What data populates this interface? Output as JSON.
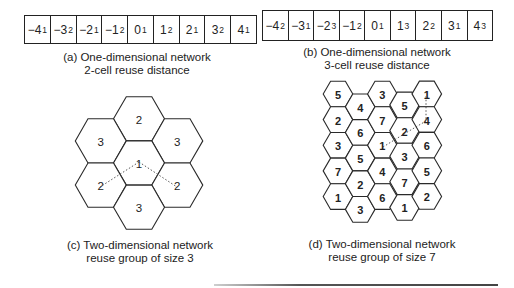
{
  "panel_a": {
    "cells": [
      {
        "base": "−4",
        "sub": "1"
      },
      {
        "base": "−3",
        "sub": "2"
      },
      {
        "base": "−2",
        "sub": "1"
      },
      {
        "base": "−1",
        "sub": "2"
      },
      {
        "base": "0",
        "sub": "1"
      },
      {
        "base": "1",
        "sub": "2"
      },
      {
        "base": "2",
        "sub": "1"
      },
      {
        "base": "3",
        "sub": "2"
      },
      {
        "base": "4",
        "sub": "1"
      }
    ],
    "caption_line1": "(a) One-dimensional network",
    "caption_line2": "2-cell reuse distance"
  },
  "panel_b": {
    "cells": [
      {
        "base": "−4",
        "sub": "2"
      },
      {
        "base": "−3",
        "sub": "1"
      },
      {
        "base": "−2",
        "sub": "3"
      },
      {
        "base": "−1",
        "sub": "2"
      },
      {
        "base": "0",
        "sub": "1"
      },
      {
        "base": "1",
        "sub": "3"
      },
      {
        "base": "2",
        "sub": "2"
      },
      {
        "base": "3",
        "sub": "1"
      },
      {
        "base": "4",
        "sub": "3"
      }
    ],
    "caption_line1": "(b) One-dimensional network",
    "caption_line2": "3-cell reuse distance"
  },
  "panel_c": {
    "cells": [
      {
        "label": "2",
        "position": "top"
      },
      {
        "label": "3",
        "position": "upper-left"
      },
      {
        "label": "3",
        "position": "upper-right"
      },
      {
        "label": "1",
        "position": "center"
      },
      {
        "label": "2",
        "position": "lower-left"
      },
      {
        "label": "2",
        "position": "lower-right"
      },
      {
        "label": "3",
        "position": "bottom"
      }
    ],
    "caption_line1": "(c) Two-dimensional network",
    "caption_line2": "reuse group of size 3"
  },
  "panel_d": {
    "columns": [
      [
        "5",
        "2",
        "3",
        "7",
        "1"
      ],
      [
        "4",
        "6",
        "5",
        "2",
        "3"
      ],
      [
        "3",
        "7",
        "1",
        "4",
        "6"
      ],
      [
        "5",
        "2",
        "3",
        "7",
        "1"
      ],
      [
        "1",
        "4",
        "6",
        "5",
        "2"
      ]
    ],
    "caption_line1": "(d) Two-dimensional network",
    "caption_line2": "reuse group of size 7"
  }
}
